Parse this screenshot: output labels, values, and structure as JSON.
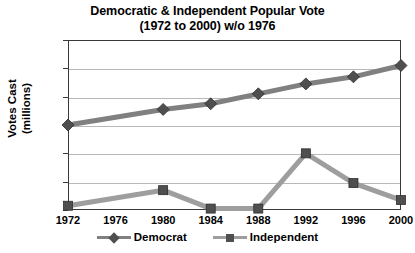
{
  "chart_data": {
    "type": "line",
    "title": "Democratic & Independent Popular Vote",
    "subtitle": "(1972 to 2000) w/o 1976",
    "xlabel": "",
    "ylabel": "Votes Cast (millions)",
    "ylabel_line1": "Votes Cast",
    "ylabel_line2": "(millions)",
    "categories": [
      "1972",
      "1976",
      "1980",
      "1984",
      "1988",
      "1992",
      "1996",
      "2000"
    ],
    "x_ticks": [
      "1972",
      "1976",
      "1980",
      "1984",
      "1988",
      "1992",
      "1996",
      "2000"
    ],
    "y_ticks": [
      "0",
      "10",
      "20",
      "30",
      "40",
      "50",
      "60"
    ],
    "ylim": [
      0,
      60
    ],
    "grid": "horizontal",
    "legend_position": "bottom",
    "note": "no data plotted for 1976",
    "series": [
      {
        "name": "Democrat",
        "marker": "diamond",
        "color": "#808080",
        "values": [
          30,
          null,
          35.5,
          37.5,
          41,
          44.5,
          47,
          51
        ]
      },
      {
        "name": "Independent",
        "marker": "square",
        "color": "#9e9e9e",
        "values": [
          1.5,
          null,
          7,
          0.5,
          0.5,
          20,
          9.5,
          3.5
        ]
      }
    ]
  },
  "legend": {
    "entries": [
      {
        "label": "Democrat"
      },
      {
        "label": "Independent"
      }
    ]
  },
  "colors": {
    "democrat": "#808080",
    "independent": "#9e9e9e",
    "marker_dark": "#4f4f4f",
    "axis": "#3a3a3a",
    "grid": "#b8b8b8",
    "background": "#ffffff"
  }
}
